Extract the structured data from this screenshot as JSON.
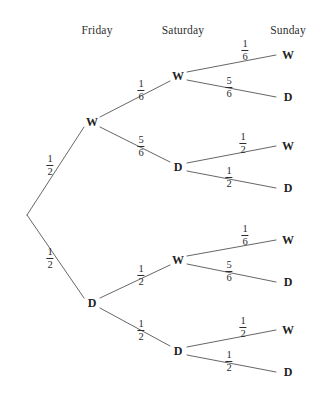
{
  "diagram": {
    "type": "probability-tree",
    "title": "",
    "headers": [
      {
        "label": "Friday",
        "x": 97,
        "y": 24
      },
      {
        "label": "Saturday",
        "x": 183,
        "y": 24
      },
      {
        "label": "Sunday",
        "x": 288,
        "y": 24
      }
    ],
    "root": {
      "x": 27,
      "y": 215
    },
    "nodes": [
      {
        "id": "f-w",
        "label": "W",
        "x": 92,
        "y": 122,
        "level": "Friday"
      },
      {
        "id": "f-d",
        "label": "D",
        "x": 92,
        "y": 303,
        "level": "Friday"
      },
      {
        "id": "f-w-s-w",
        "label": "W",
        "x": 178,
        "y": 76,
        "level": "Saturday"
      },
      {
        "id": "f-w-s-d",
        "label": "D",
        "x": 178,
        "y": 167,
        "level": "Saturday"
      },
      {
        "id": "f-d-s-w",
        "label": "W",
        "x": 178,
        "y": 260,
        "level": "Saturday"
      },
      {
        "id": "f-d-s-d",
        "label": "D",
        "x": 178,
        "y": 351,
        "level": "Saturday"
      },
      {
        "id": "l1",
        "label": "W",
        "x": 288,
        "y": 55,
        "level": "Sunday"
      },
      {
        "id": "l2",
        "label": "D",
        "x": 288,
        "y": 97,
        "level": "Sunday"
      },
      {
        "id": "l3",
        "label": "W",
        "x": 288,
        "y": 146,
        "level": "Sunday"
      },
      {
        "id": "l4",
        "label": "D",
        "x": 288,
        "y": 188,
        "level": "Sunday"
      },
      {
        "id": "l5",
        "label": "W",
        "x": 288,
        "y": 240,
        "level": "Sunday"
      },
      {
        "id": "l6",
        "label": "D",
        "x": 288,
        "y": 282,
        "level": "Sunday"
      },
      {
        "id": "l7",
        "label": "W",
        "x": 288,
        "y": 330,
        "level": "Sunday"
      },
      {
        "id": "l8",
        "label": "D",
        "x": 288,
        "y": 372,
        "level": "Sunday"
      }
    ],
    "branches": [
      {
        "id": "b-root-w",
        "from": "root",
        "to": "f-w",
        "x1": 27,
        "y1": 215,
        "x2": 84,
        "y2": 127,
        "numerator": "1",
        "denominator": "2",
        "label_x": 50,
        "label_y": 165
      },
      {
        "id": "b-root-d",
        "from": "root",
        "to": "f-d",
        "x1": 27,
        "y1": 215,
        "x2": 84,
        "y2": 298,
        "numerator": "1",
        "denominator": "2",
        "label_x": 50,
        "label_y": 258
      },
      {
        "id": "b-fw-sw",
        "from": "f-w",
        "to": "f-w-s-w",
        "x1": 100,
        "y1": 117,
        "x2": 170,
        "y2": 81,
        "numerator": "1",
        "denominator": "6",
        "label_x": 141,
        "label_y": 90
      },
      {
        "id": "b-fw-sd",
        "from": "f-w",
        "to": "f-w-s-d",
        "x1": 100,
        "y1": 127,
        "x2": 170,
        "y2": 162,
        "numerator": "5",
        "denominator": "6",
        "label_x": 141,
        "label_y": 146
      },
      {
        "id": "b-fd-sw",
        "from": "f-d",
        "to": "f-d-s-w",
        "x1": 100,
        "y1": 298,
        "x2": 170,
        "y2": 265,
        "numerator": "1",
        "denominator": "2",
        "label_x": 141,
        "label_y": 275
      },
      {
        "id": "b-fd-sd",
        "from": "f-d",
        "to": "f-d-s-d",
        "x1": 100,
        "y1": 308,
        "x2": 170,
        "y2": 346,
        "numerator": "1",
        "denominator": "2",
        "label_x": 141,
        "label_y": 330
      },
      {
        "id": "b-sw1-w",
        "from": "f-w-s-w",
        "to": "l1",
        "x1": 187,
        "y1": 72,
        "x2": 276,
        "y2": 55,
        "numerator": "1",
        "denominator": "6",
        "label_x": 245,
        "label_y": 50
      },
      {
        "id": "b-sw1-d",
        "from": "f-w-s-w",
        "to": "l2",
        "x1": 187,
        "y1": 80,
        "x2": 276,
        "y2": 97,
        "numerator": "5",
        "denominator": "6",
        "label_x": 229,
        "label_y": 87
      },
      {
        "id": "b-sd1-w",
        "from": "f-w-s-d",
        "to": "l3",
        "x1": 187,
        "y1": 163,
        "x2": 276,
        "y2": 146,
        "numerator": "1",
        "denominator": "2",
        "label_x": 243,
        "label_y": 143
      },
      {
        "id": "b-sd1-d",
        "from": "f-w-s-d",
        "to": "l4",
        "x1": 187,
        "y1": 171,
        "x2": 276,
        "y2": 188,
        "numerator": "1",
        "denominator": "2",
        "label_x": 229,
        "label_y": 177
      },
      {
        "id": "b-sw2-w",
        "from": "f-d-s-w",
        "to": "l5",
        "x1": 187,
        "y1": 256,
        "x2": 276,
        "y2": 240,
        "numerator": "1",
        "denominator": "6",
        "label_x": 245,
        "label_y": 235
      },
      {
        "id": "b-sw2-d",
        "from": "f-d-s-w",
        "to": "l6",
        "x1": 187,
        "y1": 264,
        "x2": 276,
        "y2": 282,
        "numerator": "5",
        "denominator": "6",
        "label_x": 229,
        "label_y": 271
      },
      {
        "id": "b-sd2-w",
        "from": "f-d-s-d",
        "to": "l7",
        "x1": 187,
        "y1": 347,
        "x2": 276,
        "y2": 330,
        "numerator": "1",
        "denominator": "2",
        "label_x": 243,
        "label_y": 327
      },
      {
        "id": "b-sd2-d",
        "from": "f-d-s-d",
        "to": "l8",
        "x1": 187,
        "y1": 355,
        "x2": 276,
        "y2": 372,
        "numerator": "1",
        "denominator": "2",
        "label_x": 229,
        "label_y": 361
      }
    ],
    "colors": {
      "background": "#ffffff",
      "line": "#555555",
      "text": "#2b2b2b"
    }
  }
}
